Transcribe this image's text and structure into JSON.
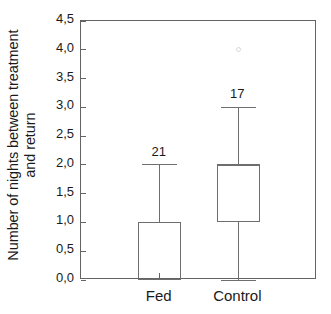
{
  "chart_data": {
    "type": "box",
    "title": "",
    "xlabel": "",
    "ylabel_line1": "Number of nights between treatment",
    "ylabel_line2": "and return",
    "ylabel": "Number of nights between treatment and return",
    "categories": [
      "Fed",
      "Control"
    ],
    "ylim": [
      0.0,
      4.5
    ],
    "ytick_values": [
      0.0,
      0.5,
      1.0,
      1.5,
      2.0,
      2.5,
      3.0,
      3.5,
      4.0,
      4.5
    ],
    "ytick_labels": [
      "0,0",
      "0,5",
      "1,0",
      "1,5",
      "2,0",
      "2,5",
      "3,0",
      "3,5",
      "4,0",
      "4,5"
    ],
    "decimal_separator": ",",
    "grid": false,
    "legend": null,
    "boxes": [
      {
        "category": "Fed",
        "n": 21,
        "n_label": "21",
        "whisker_low": 0.0,
        "q1": 0.0,
        "median": 1.0,
        "q3": 1.0,
        "whisker_high": 2.0,
        "outliers": []
      },
      {
        "category": "Control",
        "n": 17,
        "n_label": "17",
        "whisker_low": 0.0,
        "q1": 1.0,
        "median": 2.0,
        "q3": 2.0,
        "whisker_high": 3.0,
        "outliers": [
          4.0
        ]
      }
    ],
    "colors": {
      "axis": "#646464",
      "box_line": "#6e6e6e",
      "text": "#1a1a1a",
      "outlier": "#d8d8d8",
      "background": "#ffffff"
    }
  }
}
